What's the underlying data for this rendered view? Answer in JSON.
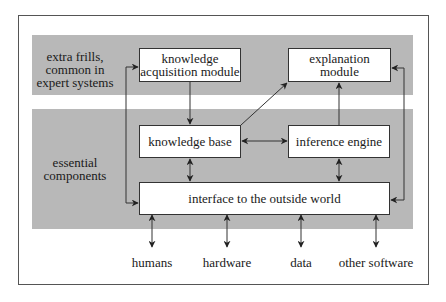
{
  "diagram": {
    "bands": {
      "top_label": "extra frills,\ncommon in\nexpert systems",
      "bottom_label": "essential\ncomponents"
    },
    "nodes": {
      "knowledge_acquisition": "knowledge\nacquisition module",
      "explanation": "explanation\nmodule",
      "knowledge_base": "knowledge base",
      "inference_engine": "inference engine",
      "interface": "interface to the outside world"
    },
    "externals": [
      "humans",
      "hardware",
      "data",
      "other software"
    ],
    "edges": [
      {
        "from": "knowledge_acquisition",
        "to": "knowledge_base",
        "type": "directed"
      },
      {
        "from": "knowledge_base",
        "to": "explanation",
        "type": "directed"
      },
      {
        "from": "inference_engine",
        "to": "explanation",
        "type": "directed"
      },
      {
        "from": "knowledge_base",
        "to": "inference_engine",
        "type": "bidirectional"
      },
      {
        "from": "knowledge_base",
        "to": "interface",
        "type": "bidirectional"
      },
      {
        "from": "inference_engine",
        "to": "interface",
        "type": "bidirectional"
      },
      {
        "from": "interface",
        "to": "knowledge_acquisition",
        "type": "bidirectional-loop-left"
      },
      {
        "from": "interface",
        "to": "explanation",
        "type": "bidirectional-loop-right"
      },
      {
        "from": "interface",
        "to": "humans",
        "type": "bidirectional"
      },
      {
        "from": "interface",
        "to": "hardware",
        "type": "bidirectional"
      },
      {
        "from": "interface",
        "to": "data",
        "type": "bidirectional"
      },
      {
        "from": "interface",
        "to": "other software",
        "type": "bidirectional"
      }
    ]
  }
}
